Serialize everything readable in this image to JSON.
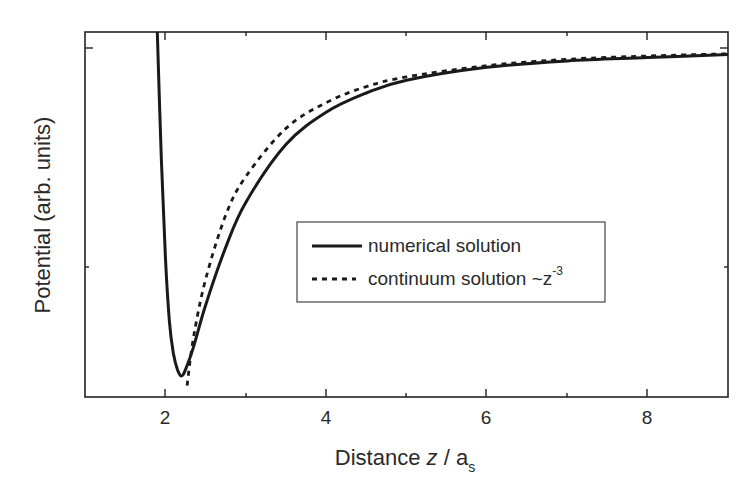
{
  "chart_data": {
    "type": "line",
    "title": "",
    "xlabel": "Distance z / a_s",
    "xlabel_parts": {
      "main": "Distance ",
      "var": "z",
      "sep": " / a",
      "sub": "s"
    },
    "ylabel": "Potential (arb. units)",
    "xlim": [
      1,
      9
    ],
    "ylim": [
      -1.05,
      0.05
    ],
    "x_ticks": [
      2,
      4,
      6,
      8
    ],
    "x_tick_labels": [
      "2",
      "4",
      "6",
      "8"
    ],
    "x_minor_ticks": [
      3,
      5,
      7
    ],
    "y_tick_labels": [],
    "grid": false,
    "legend_position": "center-right (inside)",
    "series": [
      {
        "name": "numerical solution",
        "style": "solid",
        "x": [
          1.9,
          1.95,
          2.0,
          2.05,
          2.1,
          2.15,
          2.2,
          2.25,
          2.35,
          2.5,
          2.75,
          3.0,
          3.5,
          4.0,
          4.5,
          5.0,
          6.0,
          7.0,
          8.0,
          9.0
        ],
        "y": [
          0.05,
          -0.35,
          -0.65,
          -0.85,
          -0.95,
          -1.0,
          -1.02,
          -1.0,
          -0.93,
          -0.8,
          -0.62,
          -0.48,
          -0.3,
          -0.2,
          -0.14,
          -0.1,
          -0.06,
          -0.04,
          -0.03,
          -0.02
        ]
      },
      {
        "name": "continuum solution ~z^-3",
        "style": "dashed",
        "x": [
          2.27,
          2.35,
          2.5,
          2.75,
          3.0,
          3.5,
          4.0,
          4.5,
          5.0,
          6.0,
          7.0,
          8.0,
          9.0
        ],
        "y": [
          -1.05,
          -0.9,
          -0.72,
          -0.52,
          -0.4,
          -0.25,
          -0.17,
          -0.12,
          -0.09,
          -0.055,
          -0.035,
          -0.025,
          -0.018
        ]
      }
    ],
    "legend": [
      {
        "label": "numerical solution",
        "style": "solid"
      },
      {
        "label": "continuum solution ~z",
        "superscript": "-3",
        "style": "dashed"
      }
    ]
  }
}
